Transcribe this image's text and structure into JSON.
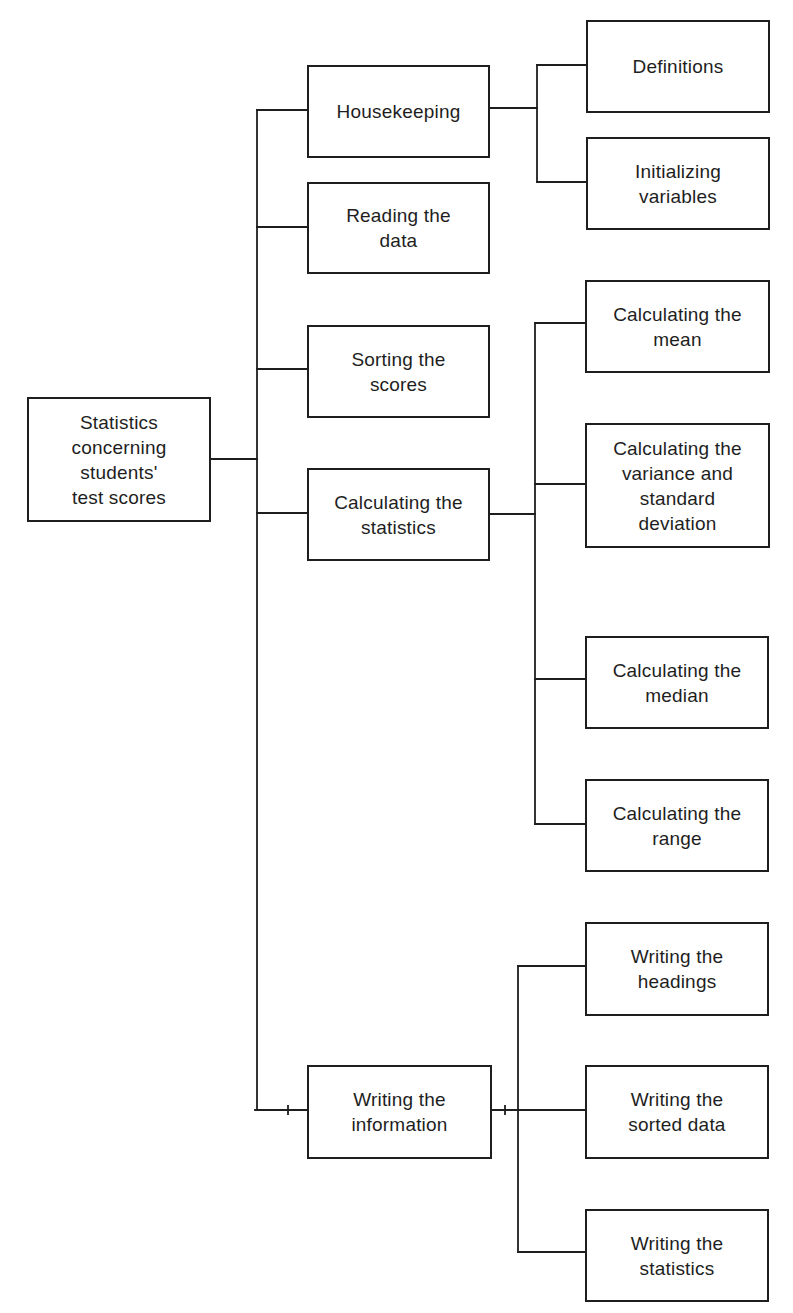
{
  "diagram": {
    "root": {
      "id": "root",
      "label": "Statistics\nconcerning\nstudents'\ntest scores"
    },
    "level1": [
      {
        "id": "housekeeping",
        "label": "Housekeeping"
      },
      {
        "id": "reading",
        "label": "Reading the\ndata"
      },
      {
        "id": "sorting",
        "label": "Sorting the\nscores"
      },
      {
        "id": "calculating",
        "label": "Calculating the\nstatistics"
      },
      {
        "id": "writing",
        "label": "Writing the\ninformation"
      }
    ],
    "level2": {
      "housekeeping": [
        {
          "id": "definitions",
          "label": "Definitions"
        },
        {
          "id": "initializing",
          "label": "Initializing\nvariables"
        }
      ],
      "calculating": [
        {
          "id": "mean",
          "label": "Calculating the\nmean"
        },
        {
          "id": "variance",
          "label": "Calculating the\nvariance and\nstandard\ndeviation"
        },
        {
          "id": "median",
          "label": "Calculating the\nmedian"
        },
        {
          "id": "range",
          "label": "Calculating the\nrange"
        }
      ],
      "writing": [
        {
          "id": "headings",
          "label": "Writing the\nheadings"
        },
        {
          "id": "sorted-data",
          "label": "Writing the\nsorted data"
        },
        {
          "id": "statistics",
          "label": "Writing the\nstatistics"
        }
      ]
    },
    "colors": {
      "stroke": "#1e1e1e",
      "background": "#ffffff",
      "text": "#1e1e1e"
    }
  }
}
